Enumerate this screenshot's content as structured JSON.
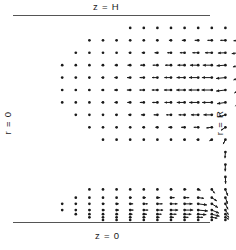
{
  "figure": {
    "title": "",
    "width": 236,
    "height": 250,
    "background": "#ffffff",
    "ink_color": "#1a1a1a"
  },
  "labels": {
    "top": "z = H",
    "bottom": "z = 0",
    "left": "r = 0",
    "right": "r = R"
  },
  "boundaries": {
    "top_line": {
      "x1": 13,
      "y1": 15.5,
      "x2": 210,
      "y2": 15.5,
      "color": "#555555",
      "width": 1.2
    },
    "bottom_line": {
      "x1": 13,
      "y1": 222.5,
      "x2": 210,
      "y2": 222.5,
      "color": "#555555",
      "width": 1.2
    }
  },
  "chart_data": {
    "type": "quiver",
    "title": "",
    "xlabel": "r",
    "ylabel": "z",
    "xlim": [
      0,
      1
    ],
    "ylim": [
      0,
      1
    ],
    "grid": false,
    "legend": null,
    "domain": {
      "r_axis": "horizontal, r = 0 at left, r = R at right",
      "z_axis": "vertical, z = 0 at bottom, z = H at top"
    },
    "grid_geometry": {
      "x_start": 35,
      "x_step": 13.6,
      "n_cols": 13,
      "y_start": 26,
      "y_step": 11.0,
      "n_rows": 18
    },
    "vector_scale_px": 11.0,
    "dot_radius_px": 1.35,
    "mask_note": "Lens-shaped masked region: the sampled grid is clipped by a rounded left boundary in both the upper and lower lobes, with an empty horizontal gap band across the middle except near the outer wall.",
    "rows": [
      {
        "z": 0.94,
        "cols": [
          8,
          9,
          10,
          11,
          12,
          13,
          14,
          15,
          16
        ],
        "u": [
          -0.02,
          -0.02,
          -0.02,
          -0.03,
          -0.03,
          -0.03,
          -0.03,
          -0.03,
          -0.02
        ],
        "v": [
          0.0,
          0.0,
          0.0,
          0.0,
          0.0,
          0.0,
          0.0,
          0.0,
          0.0
        ]
      },
      {
        "z": 0.88,
        "cols": [
          5,
          6,
          7,
          8,
          9,
          10,
          11,
          12,
          13,
          14,
          15,
          16
        ],
        "u": [
          -0.03,
          -0.04,
          -0.05,
          -0.07,
          -0.1,
          -0.14,
          -0.19,
          -0.25,
          -0.32,
          -0.4,
          -0.47,
          -0.5
        ],
        "v": [
          0.0,
          0.0,
          0.0,
          0.0,
          0.0,
          0.0,
          0.0,
          0.0,
          0.0,
          0.0,
          0.0,
          -0.04
        ]
      },
      {
        "z": 0.82,
        "cols": [
          4,
          5,
          6,
          7,
          8,
          9,
          10,
          11,
          12,
          13,
          14,
          15,
          16
        ],
        "u": [
          -0.04,
          -0.05,
          -0.07,
          -0.1,
          -0.14,
          -0.19,
          -0.26,
          -0.34,
          -0.43,
          -0.53,
          -0.62,
          -0.68,
          -0.66
        ],
        "v": [
          0.0,
          0.0,
          0.0,
          0.0,
          0.0,
          0.0,
          0.0,
          0.0,
          0.0,
          0.0,
          0.0,
          -0.03,
          -0.08
        ]
      },
      {
        "z": 0.76,
        "cols": [
          3,
          4,
          5,
          6,
          7,
          8,
          9,
          10,
          11,
          12,
          13,
          14,
          15,
          16
        ],
        "u": [
          -0.05,
          -0.07,
          -0.09,
          -0.13,
          -0.18,
          -0.25,
          -0.33,
          -0.43,
          -0.54,
          -0.65,
          -0.75,
          -0.82,
          -0.8,
          -0.55
        ],
        "v": [
          0.0,
          0.0,
          0.0,
          0.0,
          0.0,
          0.0,
          0.0,
          0.0,
          0.0,
          0.0,
          0.0,
          0.0,
          -0.06,
          -0.16
        ]
      },
      {
        "z": 0.7,
        "cols": [
          3,
          4,
          5,
          6,
          7,
          8,
          9,
          10,
          11,
          12,
          13,
          14,
          15,
          16
        ],
        "u": [
          -0.06,
          -0.08,
          -0.11,
          -0.15,
          -0.21,
          -0.29,
          -0.38,
          -0.49,
          -0.61,
          -0.73,
          -0.84,
          -0.9,
          -0.85,
          -0.5
        ],
        "v": [
          0.0,
          0.0,
          0.0,
          0.0,
          0.0,
          0.0,
          0.0,
          0.0,
          0.0,
          0.0,
          0.0,
          0.0,
          -0.08,
          -0.22
        ]
      },
      {
        "z": 0.64,
        "cols": [
          3,
          4,
          5,
          6,
          7,
          8,
          9,
          10,
          11,
          12,
          13,
          14,
          15,
          16
        ],
        "u": [
          -0.06,
          -0.08,
          -0.11,
          -0.16,
          -0.22,
          -0.3,
          -0.4,
          -0.51,
          -0.64,
          -0.76,
          -0.87,
          -0.93,
          -0.84,
          -0.42
        ],
        "v": [
          0.0,
          0.0,
          0.0,
          0.0,
          0.0,
          0.0,
          0.0,
          0.0,
          0.0,
          0.0,
          0.0,
          0.0,
          -0.1,
          -0.28
        ]
      },
      {
        "z": 0.58,
        "cols": [
          3,
          4,
          5,
          6,
          7,
          8,
          9,
          10,
          11,
          12,
          13,
          14,
          15,
          16
        ],
        "u": [
          -0.05,
          -0.07,
          -0.1,
          -0.14,
          -0.2,
          -0.27,
          -0.36,
          -0.47,
          -0.59,
          -0.71,
          -0.82,
          -0.88,
          -0.76,
          -0.32
        ],
        "v": [
          0.0,
          0.0,
          0.0,
          0.0,
          0.0,
          0.0,
          0.0,
          0.0,
          0.0,
          0.0,
          0.0,
          0.0,
          -0.12,
          -0.34
        ]
      },
      {
        "z": 0.52,
        "cols": [
          4,
          5,
          6,
          7,
          8,
          9,
          10,
          11,
          12,
          13,
          14,
          15,
          16
        ],
        "u": [
          -0.05,
          -0.07,
          -0.1,
          -0.14,
          -0.19,
          -0.26,
          -0.34,
          -0.44,
          -0.55,
          -0.66,
          -0.76,
          -0.62,
          -0.22
        ],
        "v": [
          0.0,
          0.0,
          0.0,
          0.0,
          0.0,
          0.0,
          0.0,
          0.0,
          0.0,
          0.0,
          0.0,
          -0.18,
          -0.42
        ]
      },
      {
        "z": 0.46,
        "cols": [
          5,
          6,
          7,
          8,
          9,
          10,
          11,
          12,
          13,
          14,
          15,
          16
        ],
        "u": [
          -0.04,
          -0.05,
          -0.07,
          -0.1,
          -0.14,
          -0.19,
          -0.25,
          -0.32,
          -0.41,
          -0.5,
          -0.4,
          -0.12
        ],
        "v": [
          0.0,
          0.0,
          0.0,
          0.0,
          0.0,
          0.0,
          0.0,
          0.0,
          0.0,
          -0.06,
          -0.28,
          -0.52
        ]
      },
      {
        "z": 0.4,
        "cols": [
          6,
          7,
          8,
          9,
          10,
          11,
          12,
          13,
          14,
          15,
          16
        ],
        "u": [
          -0.02,
          -0.03,
          -0.04,
          -0.05,
          -0.07,
          -0.09,
          -0.12,
          -0.16,
          -0.22,
          -0.2,
          -0.06
        ],
        "v": [
          0.0,
          0.0,
          0.0,
          0.0,
          0.0,
          0.0,
          0.0,
          0.0,
          -0.1,
          -0.4,
          -0.62
        ]
      },
      {
        "z": 0.34,
        "cols": [
          15,
          16
        ],
        "u": [
          -0.04,
          -0.02
        ],
        "v": [
          -0.55,
          -0.7
        ]
      },
      {
        "z": 0.28,
        "cols": [
          15,
          16
        ],
        "u": [
          -0.02,
          -0.01
        ],
        "v": [
          -0.62,
          -0.76
        ]
      },
      {
        "z": 0.22,
        "cols": [
          15,
          16
        ],
        "u": [
          0.02,
          0.01
        ],
        "v": [
          -0.62,
          -0.78
        ]
      },
      {
        "z": 0.16,
        "cols": [
          5,
          6,
          7,
          8,
          9,
          10,
          11,
          12,
          13,
          14,
          15,
          16
        ],
        "u": [
          0.02,
          0.03,
          0.04,
          0.05,
          0.07,
          0.09,
          0.12,
          0.16,
          0.22,
          0.26,
          0.22,
          0.06
        ],
        "v": [
          0.0,
          0.0,
          0.0,
          0.0,
          0.0,
          0.0,
          0.0,
          0.0,
          -0.08,
          -0.36,
          -0.58,
          -0.72
        ]
      },
      {
        "z": 0.12,
        "cols": [
          4,
          5,
          6,
          7,
          8,
          9,
          10,
          11,
          12,
          13,
          14,
          15,
          16
        ],
        "u": [
          0.04,
          0.05,
          0.07,
          0.1,
          0.14,
          0.19,
          0.25,
          0.33,
          0.42,
          0.52,
          0.46,
          0.2,
          0.08
        ],
        "v": [
          0.0,
          0.0,
          0.0,
          0.0,
          0.0,
          0.0,
          0.0,
          0.0,
          0.0,
          -0.06,
          -0.3,
          -0.55,
          -0.66
        ]
      },
      {
        "z": 0.09,
        "cols": [
          3,
          4,
          5,
          6,
          7,
          8,
          9,
          10,
          11,
          12,
          13,
          14,
          15,
          16
        ],
        "u": [
          0.05,
          0.07,
          0.1,
          0.14,
          0.2,
          0.27,
          0.36,
          0.47,
          0.59,
          0.72,
          0.8,
          0.56,
          0.24,
          0.1
        ],
        "v": [
          0.0,
          0.0,
          0.0,
          0.0,
          0.0,
          0.0,
          0.0,
          0.0,
          0.0,
          0.0,
          -0.1,
          -0.34,
          -0.5,
          -0.58
        ]
      },
      {
        "z": 0.06,
        "cols": [
          3,
          4,
          5,
          6,
          7,
          8,
          9,
          10,
          11,
          12,
          13,
          14,
          15,
          16
        ],
        "u": [
          0.06,
          0.08,
          0.11,
          0.16,
          0.22,
          0.3,
          0.4,
          0.52,
          0.65,
          0.78,
          0.88,
          0.66,
          0.28,
          0.1
        ],
        "v": [
          0.0,
          0.0,
          0.0,
          0.0,
          0.0,
          0.0,
          0.0,
          0.0,
          0.0,
          0.0,
          -0.08,
          -0.28,
          -0.42,
          -0.48
        ]
      },
      {
        "z": 0.04,
        "cols": [
          4,
          5,
          6,
          7,
          8,
          9,
          10,
          11,
          12,
          13,
          14,
          15,
          16
        ],
        "u": [
          0.06,
          0.08,
          0.11,
          0.15,
          0.21,
          0.29,
          0.38,
          0.5,
          0.62,
          0.74,
          0.7,
          0.34,
          0.1
        ],
        "v": [
          0.0,
          0.0,
          0.0,
          0.0,
          0.0,
          0.0,
          0.0,
          0.0,
          0.0,
          -0.04,
          -0.18,
          -0.3,
          -0.34
        ]
      },
      {
        "z": 0.025,
        "cols": [
          5,
          6,
          7,
          8,
          9,
          10,
          11,
          12,
          13,
          14,
          15,
          16
        ],
        "u": [
          0.04,
          0.06,
          0.08,
          0.11,
          0.15,
          0.2,
          0.27,
          0.35,
          0.44,
          0.5,
          0.32,
          0.1
        ],
        "v": [
          0.0,
          0.0,
          0.0,
          0.0,
          0.0,
          0.0,
          0.0,
          0.0,
          0.0,
          -0.08,
          -0.18,
          -0.2
        ]
      },
      {
        "z": 0.012,
        "cols": [
          6,
          7,
          8,
          9,
          10,
          11,
          12,
          13,
          14,
          15,
          16
        ],
        "u": [
          0.02,
          0.03,
          0.03,
          0.04,
          0.05,
          0.06,
          0.07,
          0.08,
          0.09,
          0.07,
          0.03
        ],
        "v": [
          0.0,
          0.0,
          0.0,
          0.0,
          0.0,
          0.0,
          0.0,
          0.0,
          0.0,
          0.0,
          0.0
        ]
      }
    ]
  }
}
